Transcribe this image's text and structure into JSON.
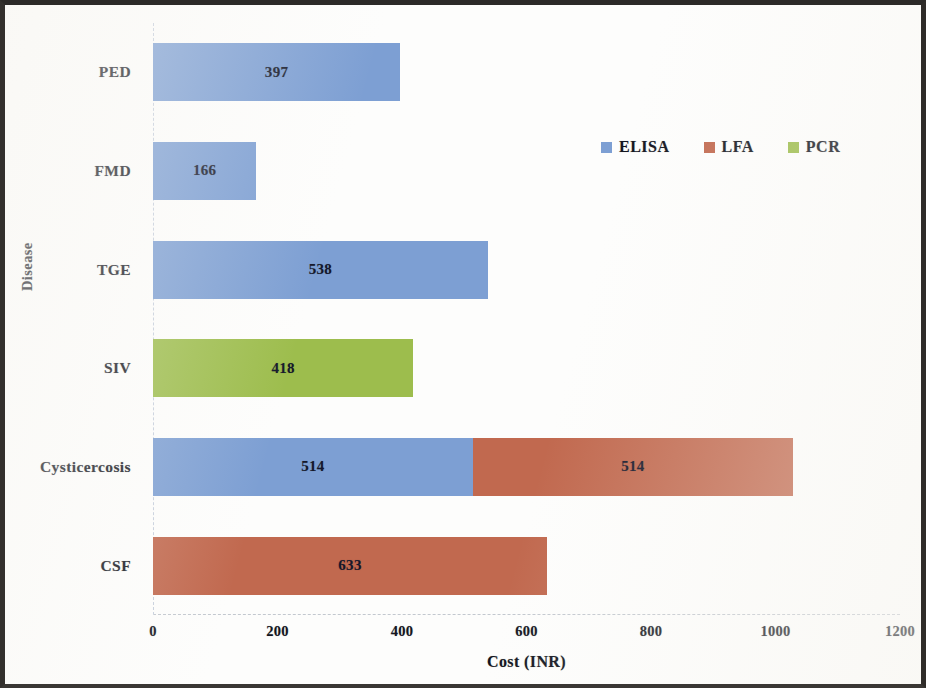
{
  "chart_data": {
    "type": "bar",
    "orientation": "horizontal",
    "stacked": true,
    "title": "",
    "xlabel": "Cost (INR)",
    "ylabel": "Disease",
    "xlim": [
      0,
      1200
    ],
    "xticks": [
      "0",
      "200",
      "400",
      "600",
      "800",
      "1000",
      "1200"
    ],
    "grid": false,
    "legend_position": "top-right",
    "categories": [
      "PED",
      "FMD",
      "TGE",
      "SIV",
      "Cysticercosis",
      "CSF"
    ],
    "series": [
      {
        "name": "ELISA",
        "color": "#7d9fd3",
        "values": [
          397,
          166,
          538,
          0,
          514,
          0
        ]
      },
      {
        "name": "LFA",
        "color": "#c1694f",
        "values": [
          0,
          0,
          0,
          0,
          514,
          633
        ]
      },
      {
        "name": "PCR",
        "color": "#9dbd4d",
        "values": [
          0,
          0,
          0,
          418,
          0,
          0
        ]
      }
    ],
    "bars": [
      {
        "category": "PED",
        "segments": [
          {
            "series": "ELISA",
            "value": 397,
            "label": "397"
          }
        ],
        "total": 397
      },
      {
        "category": "FMD",
        "segments": [
          {
            "series": "ELISA",
            "value": 166,
            "label": "166"
          }
        ],
        "total": 166
      },
      {
        "category": "TGE",
        "segments": [
          {
            "series": "ELISA",
            "value": 538,
            "label": "538"
          }
        ],
        "total": 538
      },
      {
        "category": "SIV",
        "segments": [
          {
            "series": "PCR",
            "value": 418,
            "label": "418"
          }
        ],
        "total": 418
      },
      {
        "category": "Cysticercosis",
        "segments": [
          {
            "series": "ELISA",
            "value": 514,
            "label": "514"
          },
          {
            "series": "LFA",
            "value": 514,
            "label": "514"
          }
        ],
        "total": 1028
      },
      {
        "category": "CSF",
        "segments": [
          {
            "series": "LFA",
            "value": 633,
            "label": "633"
          }
        ],
        "total": 633
      }
    ]
  },
  "axes": {
    "x_title": "Cost (INR)",
    "y_title": "Disease",
    "x_tick_labels": [
      "0",
      "200",
      "400",
      "600",
      "800",
      "1000",
      "1200"
    ],
    "y_tick_labels": [
      "PED",
      "FMD",
      "TGE",
      "SIV",
      "Cysticercosis",
      "CSF"
    ]
  },
  "legend": {
    "items": [
      {
        "label": "ELISA",
        "color": "#7d9fd3"
      },
      {
        "label": "LFA",
        "color": "#c1694f"
      },
      {
        "label": "PCR",
        "color": "#9dbd4d"
      }
    ]
  }
}
